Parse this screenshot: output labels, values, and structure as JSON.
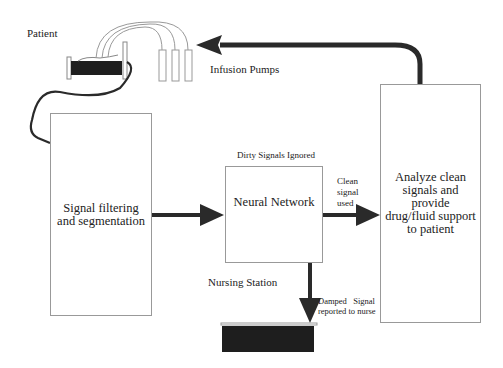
{
  "labels": {
    "patient": "Patient",
    "infusion_pumps": "Infusion Pumps",
    "dirty_signals": "Dirty Signals Ignored",
    "clean_signal_line1": "Clean",
    "clean_signal_line2": "signal",
    "clean_signal_line3": "used",
    "nursing_station": "Nursing Station",
    "damped_line1": "Damped   Signal",
    "damped_line2": "reported to nurse"
  },
  "boxes": {
    "filter": {
      "line1": "Signal filtering",
      "line2": "and segmentation"
    },
    "neural": {
      "label": "Neural Network"
    },
    "analyze": {
      "line1": "Analyze clean",
      "line2": "signals and",
      "line3": "provide",
      "line4": "drug/fluid support",
      "line5": "to patient"
    }
  },
  "colors": {
    "line": "#2a2a2a",
    "box_border": "#999999",
    "fill_dark": "#1e1e1e"
  }
}
